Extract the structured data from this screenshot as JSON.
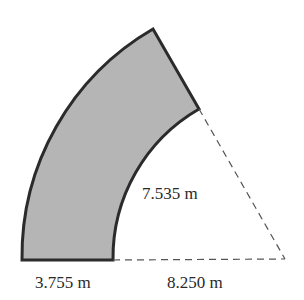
{
  "diagram": {
    "type": "annular-sector",
    "angle_deg": 60,
    "fill_color": "#b5b5b5",
    "stroke_color": "#2b2b2b",
    "labels": {
      "width": "3.755 m",
      "inner_radius": "8.250 m",
      "inner_arc": "7.535 m"
    }
  }
}
